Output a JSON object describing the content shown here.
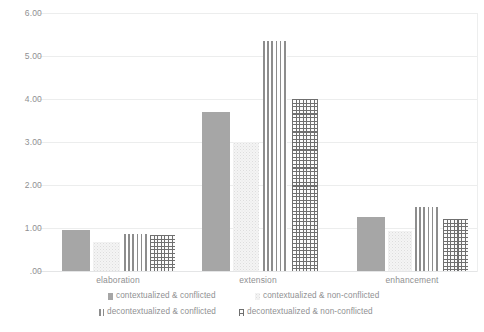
{
  "chart_data": {
    "type": "bar",
    "title": "",
    "subtitle": "",
    "xlabel": "",
    "ylabel": "",
    "ylim": [
      0,
      6
    ],
    "ytick_labels": [
      "6.00",
      "5.00",
      "4.00",
      "3.00",
      "2.00",
      "1.00",
      ".00"
    ],
    "ytick_values": [
      6,
      5,
      4,
      3,
      2,
      1,
      0
    ],
    "grid": true,
    "legend_position": "bottom",
    "categories": [
      "elaboration",
      "extension",
      "enhancement"
    ],
    "series": [
      {
        "name": "contextualized & conflicted",
        "fill": "solid",
        "color": "#a6a6a6",
        "values": [
          0.95,
          3.7,
          1.25
        ]
      },
      {
        "name": "contextualized & non-conflicted",
        "fill": "dots",
        "color": "#f4f4f4",
        "values": [
          0.67,
          3.0,
          0.92
        ]
      },
      {
        "name": "decontextualized & conflicted",
        "fill": "vertical-stripes",
        "color": "#8d8d8d",
        "values": [
          0.85,
          5.35,
          1.5
        ]
      },
      {
        "name": "decontextualized & non-conflicted",
        "fill": "crosshatch",
        "color": "#6f6f6f",
        "values": [
          0.83,
          4.0,
          1.2
        ]
      }
    ]
  },
  "legend": {
    "items": [
      {
        "label": "contextualized & conflicted"
      },
      {
        "label": "contextualized & non-conflicted"
      },
      {
        "label": "decontextualized & conflicted"
      },
      {
        "label": "decontextualized & non-conflicted"
      }
    ]
  }
}
